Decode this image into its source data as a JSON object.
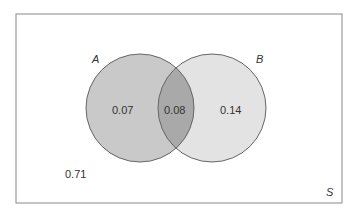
{
  "diagram": {
    "type": "venn",
    "universe_label": "S",
    "sets": [
      {
        "name": "A",
        "label": "A"
      },
      {
        "name": "B",
        "label": "B"
      }
    ],
    "regions": {
      "a_only": "0.07",
      "a_and_b": "0.08",
      "b_only": "0.14",
      "neither": "0.71"
    },
    "colors": {
      "a_fill": "#c9c9c9",
      "b_fill": "#e3e3e3",
      "overlap_fill": "#a9a9a9",
      "stroke": "#666666",
      "border": "#888888"
    }
  }
}
